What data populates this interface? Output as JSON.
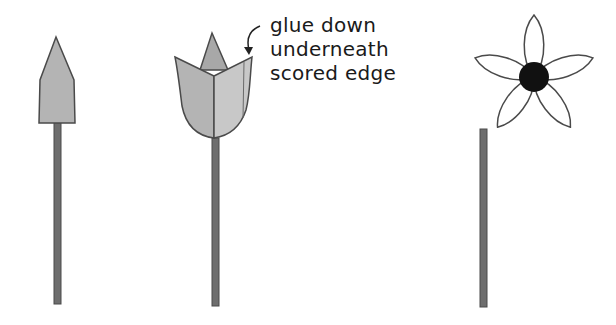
{
  "annotation": {
    "lines": [
      "glue down",
      "underneath",
      "scored edge"
    ]
  },
  "colors": {
    "petal_fill": "#b4b4b4",
    "petal_fill_light": "#c8c8c8",
    "outline": "#4a4a4a",
    "stem": "#6e6e6e",
    "flower_center": "#111111",
    "flower_petal": "#ffffff"
  },
  "steps": [
    {
      "name": "step-1-pointed-petal-on-stem"
    },
    {
      "name": "step-2-folded-tulip-on-stem"
    },
    {
      "name": "step-3-five-petal-flower-and-stem"
    }
  ]
}
